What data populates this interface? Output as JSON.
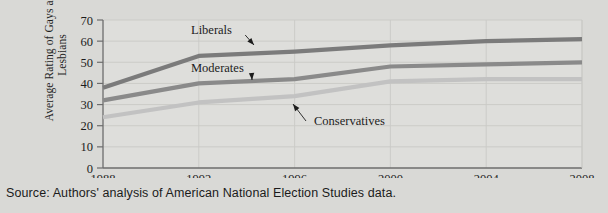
{
  "chart_data": {
    "type": "line",
    "title": "",
    "xlabel": "",
    "ylabel": "Average Rating of Gays and Lesbians",
    "x": [
      "1988",
      "1992",
      "1996",
      "2000",
      "2004",
      "2008"
    ],
    "xticklabels": [
      "1988",
      "1992",
      "1996",
      "2000",
      "2004",
      "2008"
    ],
    "yticklabels": [
      "0",
      "10",
      "20",
      "30",
      "40",
      "50",
      "60",
      "70"
    ],
    "yticks": [
      0,
      10,
      20,
      30,
      40,
      50,
      60,
      70
    ],
    "ylim": [
      0,
      70
    ],
    "grid": true,
    "legend_position": "inline-annotations",
    "series": [
      {
        "name": "Liberals",
        "color": "#7b7b7b",
        "values": [
          38,
          53,
          55,
          58,
          60,
          61
        ]
      },
      {
        "name": "Moderates",
        "color": "#8a8a8a",
        "values": [
          32,
          40,
          42,
          48,
          49,
          50
        ]
      },
      {
        "name": "Conservatives",
        "color": "#c2c2c2",
        "values": [
          24,
          31,
          34,
          41,
          42,
          42
        ]
      }
    ],
    "annotations": [
      {
        "label": "Liberals",
        "target_series": "Liberals"
      },
      {
        "label": "Moderates",
        "target_series": "Moderates"
      },
      {
        "label": "Conservatives",
        "target_series": "Conservatives"
      }
    ]
  },
  "caption": {
    "source_text": "Source: Authors' analysis of American National Election Studies data."
  },
  "colors": {
    "background": "#d9d9d6",
    "plot_background": "#dededb",
    "axis": "#6d6d6d",
    "grid": "#c9c9c6",
    "text": "#1c1c1c"
  }
}
